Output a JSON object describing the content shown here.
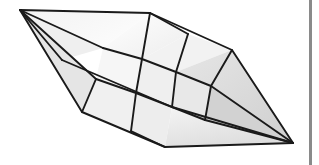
{
  "figure": {
    "caption": "",
    "background_color": "#ffffff",
    "edge_color": "#1a1a1a",
    "edge_width": 1.9,
    "fill_light": "#fbfbfb",
    "fill_mid": "#ededed",
    "fill_dark": "#d6d6d6",
    "fill_darker": "#c9c9c9",
    "rule_color": "#8a8a8a",
    "rule_x": 309,
    "rule_width": 3
  },
  "chart_data": {
    "type": "diagram-mesh",
    "width": 319,
    "height": 165,
    "vertices": {
      "left_apex": [
        20,
        10
      ],
      "right_apex": [
        293,
        143
      ],
      "top_a": [
        150,
        13
      ],
      "top_b": [
        188,
        34
      ],
      "top_c": [
        232,
        50
      ],
      "bot_a": [
        82,
        112
      ],
      "bot_b": [
        131,
        131
      ],
      "bot_c": [
        165,
        147
      ],
      "m1": [
        103,
        48
      ],
      "m2": [
        142,
        59
      ],
      "m3": [
        176,
        72
      ],
      "m4": [
        211,
        86
      ],
      "m5": [
        96,
        79
      ],
      "m6": [
        136,
        93
      ],
      "m7": [
        172,
        107
      ],
      "m8": [
        205,
        120
      ],
      "n1": [
        62,
        60
      ],
      "n2": [
        44,
        36
      ],
      "n3": [
        255,
        118
      ],
      "n4": [
        272,
        97
      ]
    },
    "faces": [
      {
        "name": "fan-upper-left-1",
        "points": [
          [
            20,
            10
          ],
          [
            150,
            13
          ],
          [
            103,
            48
          ]
        ],
        "fill": "#f4f4f4"
      },
      {
        "name": "fan-upper-left-2",
        "points": [
          [
            20,
            10
          ],
          [
            103,
            48
          ],
          [
            62,
            60
          ]
        ],
        "fill": "#efefef"
      },
      {
        "name": "fan-upper-left-3",
        "points": [
          [
            20,
            10
          ],
          [
            62,
            60
          ],
          [
            44,
            36
          ]
        ],
        "fill": "#f7f7f7"
      },
      {
        "name": "fan-lower-left-1",
        "points": [
          [
            20,
            10
          ],
          [
            62,
            60
          ],
          [
            96,
            79
          ]
        ],
        "fill": "#ebebeb"
      },
      {
        "name": "fan-lower-left-2",
        "points": [
          [
            20,
            10
          ],
          [
            96,
            79
          ],
          [
            82,
            112
          ]
        ],
        "fill": "#e4e4e4"
      },
      {
        "name": "quad-a",
        "points": [
          [
            150,
            13
          ],
          [
            188,
            34
          ],
          [
            142,
            59
          ],
          [
            103,
            48
          ]
        ],
        "fill": "#f9f9f9"
      },
      {
        "name": "quad-b",
        "points": [
          [
            188,
            34
          ],
          [
            232,
            50
          ],
          [
            176,
            72
          ],
          [
            142,
            59
          ]
        ],
        "fill": "#f2f2f2"
      },
      {
        "name": "quad-c",
        "points": [
          [
            103,
            48
          ],
          [
            142,
            59
          ],
          [
            136,
            93
          ],
          [
            96,
            79
          ]
        ],
        "fill": "#f6f6f6"
      },
      {
        "name": "quad-d",
        "points": [
          [
            142,
            59
          ],
          [
            176,
            72
          ],
          [
            172,
            107
          ],
          [
            136,
            93
          ]
        ],
        "fill": "#efefef"
      },
      {
        "name": "quad-e",
        "points": [
          [
            176,
            72
          ],
          [
            211,
            86
          ],
          [
            205,
            120
          ],
          [
            172,
            107
          ]
        ],
        "fill": "#e8e8e8"
      },
      {
        "name": "quad-f",
        "points": [
          [
            96,
            79
          ],
          [
            136,
            93
          ],
          [
            131,
            131
          ],
          [
            82,
            112
          ]
        ],
        "fill": "#f0f0f0"
      },
      {
        "name": "quad-g",
        "points": [
          [
            136,
            93
          ],
          [
            172,
            107
          ],
          [
            165,
            147
          ],
          [
            131,
            131
          ]
        ],
        "fill": "#ededed"
      },
      {
        "name": "fan-right-upper",
        "points": [
          [
            232,
            50
          ],
          [
            293,
            143
          ],
          [
            211,
            86
          ],
          [
            176,
            72
          ]
        ],
        "fill": "#dcdcdc"
      },
      {
        "name": "fan-right-mid",
        "points": [
          [
            211,
            86
          ],
          [
            293,
            143
          ],
          [
            205,
            120
          ]
        ],
        "fill": "#d2d2d2"
      },
      {
        "name": "fan-right-lower",
        "points": [
          [
            205,
            120
          ],
          [
            293,
            143
          ],
          [
            172,
            107
          ]
        ],
        "fill": "#d9d9d9"
      },
      {
        "name": "fan-bottom-right",
        "points": [
          [
            165,
            147
          ],
          [
            293,
            143
          ],
          [
            205,
            120
          ],
          [
            172,
            107
          ]
        ],
        "fill": "#e2e2e2"
      }
    ],
    "edges": [
      {
        "name": "silhouette-top-left",
        "from": [
          20,
          10
        ],
        "to": [
          150,
          13
        ]
      },
      {
        "name": "silhouette-top-right",
        "from": [
          150,
          13
        ],
        "to": [
          232,
          50
        ]
      },
      {
        "name": "silhouette-upper-right",
        "from": [
          232,
          50
        ],
        "to": [
          293,
          143
        ]
      },
      {
        "name": "silhouette-bottom",
        "from": [
          293,
          143
        ],
        "to": [
          165,
          147
        ]
      },
      {
        "name": "silhouette-bottom-left",
        "from": [
          165,
          147
        ],
        "to": [
          82,
          112
        ]
      },
      {
        "name": "silhouette-left-lower",
        "from": [
          82,
          112
        ],
        "to": [
          20,
          10
        ]
      },
      {
        "name": "fan-edge-1",
        "from": [
          20,
          10
        ],
        "to": [
          103,
          48
        ]
      },
      {
        "name": "fan-edge-2",
        "from": [
          20,
          10
        ],
        "to": [
          62,
          60
        ]
      },
      {
        "name": "fan-edge-3",
        "from": [
          20,
          10
        ],
        "to": [
          96,
          79
        ]
      },
      {
        "name": "grid-row-1",
        "from": [
          103,
          48
        ],
        "to": [
          211,
          86
        ]
      },
      {
        "name": "grid-row-2",
        "from": [
          96,
          79
        ],
        "to": [
          205,
          120
        ]
      },
      {
        "name": "grid-col-1",
        "from": [
          150,
          13
        ],
        "to": [
          131,
          131
        ]
      },
      {
        "name": "grid-col-2",
        "from": [
          188,
          34
        ],
        "to": [
          172,
          107
        ]
      },
      {
        "name": "grid-col-3",
        "from": [
          232,
          50
        ],
        "to": [
          205,
          120
        ]
      },
      {
        "name": "fan-edge-r1",
        "from": [
          293,
          143
        ],
        "to": [
          211,
          86
        ]
      },
      {
        "name": "fan-edge-r2",
        "from": [
          293,
          143
        ],
        "to": [
          205,
          120
        ]
      },
      {
        "name": "fan-edge-r3",
        "from": [
          293,
          143
        ],
        "to": [
          172,
          107
        ]
      },
      {
        "name": "grid-diag-mid",
        "from": [
          62,
          60
        ],
        "to": [
          172,
          107
        ]
      }
    ],
    "xlabel": "",
    "ylabel": "",
    "legend": []
  }
}
